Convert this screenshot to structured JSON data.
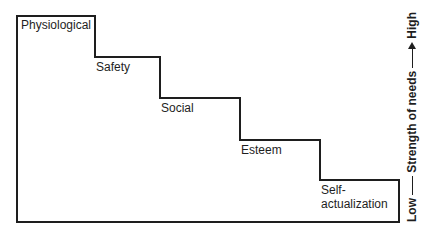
{
  "diagram": {
    "type": "staircase",
    "title": "",
    "steps": [
      {
        "label": "Physiological",
        "level": 5
      },
      {
        "label": "Safety",
        "level": 4
      },
      {
        "label": "Social",
        "level": 3
      },
      {
        "label": "Esteem",
        "level": 2
      },
      {
        "label": "Self-\nactualization",
        "level": 1
      }
    ],
    "labels": {
      "physiological": "Physiological",
      "safety": "Safety",
      "social": "Social",
      "esteem": "Esteem",
      "self_line1": "Self-",
      "self_line2": "actualization"
    },
    "axis": {
      "low": "Low",
      "middle": "Strength of needs",
      "high": "High"
    },
    "colors": {
      "line": "#1e1e1e",
      "background": "#ffffff"
    }
  }
}
